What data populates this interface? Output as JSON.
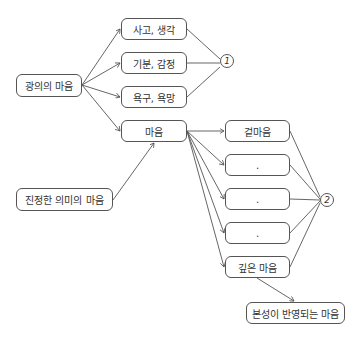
{
  "diagram": {
    "nodes": {
      "root": "광의의 마음",
      "thought": "사고, 생각",
      "emotion": "기분, 감정",
      "desire": "욕구, 욕망",
      "mind": "마음",
      "true_mind": "진정한 의미의 마음",
      "outer_mind": "겉마음",
      "mid1": ".",
      "mid2": ".",
      "mid3": ".",
      "deep_mind": "깊은 마음",
      "nature_mind": "본성이 반영되는 마음"
    },
    "groups": {
      "group1": "1",
      "group2": "2"
    }
  }
}
